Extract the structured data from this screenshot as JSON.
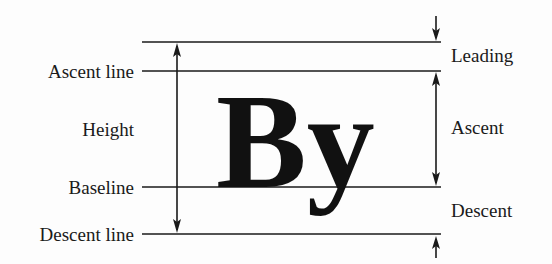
{
  "diagram": {
    "sample_text": "By",
    "left_labels": {
      "ascent_line": "Ascent line",
      "height": "Height",
      "baseline": "Baseline",
      "descent_line": "Descent line"
    },
    "right_labels": {
      "leading": "Leading",
      "ascent": "Ascent",
      "descent": "Descent"
    },
    "colors": {
      "ink": "#1a1a1a",
      "background": "#fdfdfd"
    }
  }
}
